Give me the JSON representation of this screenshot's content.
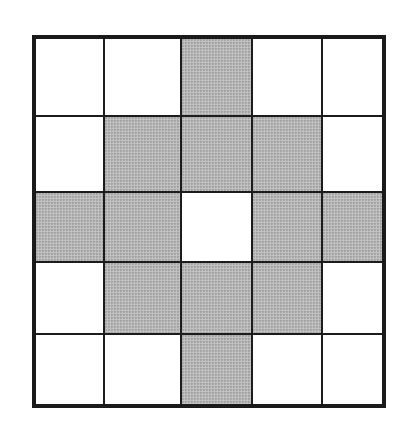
{
  "diagram": {
    "type": "grid",
    "rows": 5,
    "cols": 5,
    "colors": {
      "shaded": "#b9b9b9",
      "empty": "#ffffff",
      "border": "#1a1a1a"
    },
    "cells": [
      [
        0,
        0,
        1,
        0,
        0
      ],
      [
        0,
        1,
        1,
        1,
        0
      ],
      [
        1,
        1,
        0,
        1,
        1
      ],
      [
        0,
        1,
        1,
        1,
        0
      ],
      [
        0,
        0,
        1,
        0,
        0
      ]
    ],
    "shaded_count": 12,
    "center_cell": "unshaded"
  }
}
